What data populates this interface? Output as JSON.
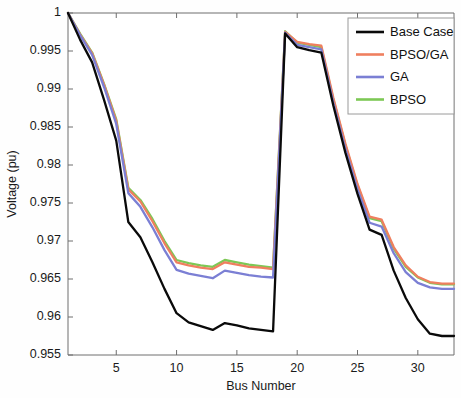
{
  "chart_data": {
    "type": "line",
    "title": "",
    "xlabel": "Bus Number",
    "ylabel": "Voltage (pu)",
    "xlim": [
      1,
      33
    ],
    "ylim": [
      0.955,
      1
    ],
    "xticks": [
      5,
      10,
      15,
      20,
      25,
      30
    ],
    "xtick_labels": [
      "5",
      "10",
      "15",
      "20",
      "25",
      "30"
    ],
    "yticks": [
      0.955,
      0.96,
      0.965,
      0.97,
      0.975,
      0.98,
      0.985,
      0.99,
      0.995,
      1
    ],
    "ytick_labels": [
      "0.955",
      "0.96",
      "0.965",
      "0.97",
      "0.975",
      "0.98",
      "0.985",
      "0.99",
      "0.995",
      "1"
    ],
    "grid": false,
    "legend_position": "top-right",
    "x": [
      1,
      2,
      3,
      4,
      5,
      6,
      7,
      8,
      9,
      10,
      11,
      12,
      13,
      14,
      15,
      16,
      17,
      18,
      19,
      20,
      21,
      22,
      23,
      24,
      25,
      26,
      27,
      28,
      29,
      30,
      31,
      32,
      33
    ],
    "series": [
      {
        "name": "Base Case",
        "color": "#0a0a0a",
        "values": [
          1.0,
          0.9965,
          0.9935,
          0.9885,
          0.9832,
          0.9725,
          0.9705,
          0.9672,
          0.9637,
          0.9605,
          0.9593,
          0.9588,
          0.9583,
          0.9592,
          0.9589,
          0.9585,
          0.9583,
          0.9581,
          0.9973,
          0.9955,
          0.9951,
          0.9948,
          0.9878,
          0.9816,
          0.9762,
          0.9715,
          0.9708,
          0.9661,
          0.9625,
          0.9597,
          0.9578,
          0.9575,
          0.9575
        ]
      },
      {
        "name": "BPSO/GA",
        "color": "#ef7f5f",
        "values": [
          1.0,
          0.9972,
          0.9947,
          0.9905,
          0.9858,
          0.9768,
          0.9752,
          0.9726,
          0.9697,
          0.9672,
          0.9668,
          0.9665,
          0.9663,
          0.9672,
          0.9669,
          0.9666,
          0.9665,
          0.9663,
          0.9975,
          0.9962,
          0.9959,
          0.9957,
          0.9888,
          0.9828,
          0.9775,
          0.9732,
          0.9728,
          0.9692,
          0.9668,
          0.9653,
          0.9646,
          0.9644,
          0.9644
        ]
      },
      {
        "name": "GA",
        "color": "#7b7fd4",
        "values": [
          1.0,
          0.9971,
          0.9945,
          0.9902,
          0.9854,
          0.9763,
          0.9745,
          0.9718,
          0.9688,
          0.9662,
          0.9657,
          0.9654,
          0.9651,
          0.9661,
          0.9658,
          0.9655,
          0.9653,
          0.9652,
          0.9974,
          0.9958,
          0.9955,
          0.9952,
          0.9882,
          0.9821,
          0.9768,
          0.9724,
          0.9719,
          0.9684,
          0.9659,
          0.9645,
          0.9639,
          0.9637,
          0.9637
        ]
      },
      {
        "name": "BPSO",
        "color": "#7dc855",
        "values": [
          1.0,
          0.9973,
          0.9948,
          0.9906,
          0.986,
          0.977,
          0.9754,
          0.9729,
          0.97,
          0.9675,
          0.9671,
          0.9668,
          0.9666,
          0.9675,
          0.9672,
          0.9669,
          0.9667,
          0.9665,
          0.9976,
          0.9961,
          0.9958,
          0.9955,
          0.9886,
          0.9826,
          0.9773,
          0.973,
          0.9726,
          0.969,
          0.9666,
          0.9652,
          0.9645,
          0.9643,
          0.9643
        ]
      }
    ]
  },
  "legend": {
    "entries": [
      {
        "label": "Base Case"
      },
      {
        "label": "BPSO/GA"
      },
      {
        "label": "GA"
      },
      {
        "label": "BPSO"
      }
    ]
  }
}
